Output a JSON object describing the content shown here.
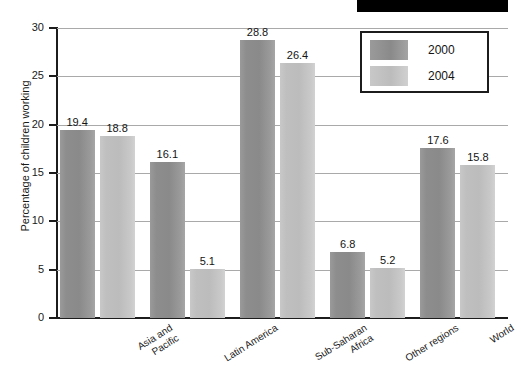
{
  "decor": {
    "top_black_bar": "redaction-bar"
  },
  "chart_data": {
    "type": "bar",
    "title": "",
    "subtitle": "",
    "xlabel": "",
    "ylabel": "Percentage of children working",
    "ylim": [
      0,
      30
    ],
    "yticks": [
      0,
      5,
      10,
      15,
      20,
      25,
      30
    ],
    "ytick_labels": [
      "0",
      "5",
      "10",
      "15",
      "20",
      "25",
      "30"
    ],
    "grid": true,
    "grid_axis": "y",
    "legend_position": "top-right",
    "categories": [
      "Asia and Pacific",
      "Latin America",
      "Sub-Saharan Africa",
      "Other regions",
      "World"
    ],
    "category_lines": [
      [
        "Asia and",
        "Pacific"
      ],
      [
        "Latin America"
      ],
      [
        "Sub-Saharan",
        "Africa"
      ],
      [
        "Other regions"
      ],
      [
        "World"
      ]
    ],
    "series": [
      {
        "name": "2000",
        "color": "#8a8a8a",
        "values": [
          19.4,
          16.1,
          28.8,
          6.8,
          17.6
        ],
        "labels": [
          "19.4",
          "16.1",
          "28.8",
          "6.8",
          "17.6"
        ]
      },
      {
        "name": "2004",
        "color": "#bfbfbf",
        "values": [
          18.8,
          5.1,
          26.4,
          5.2,
          15.8
        ],
        "labels": [
          "18.8",
          "5.1",
          "26.4",
          "5.2",
          "15.8"
        ]
      }
    ]
  },
  "legend": {
    "entries": [
      {
        "label": "2000"
      },
      {
        "label": "2004"
      }
    ]
  },
  "colors": {
    "series_2000": "#8a8a8a",
    "series_2004": "#bfbfbf",
    "axis": "#1c1c1c",
    "gridline": "#a9a9a9",
    "text": "#1a1a1a",
    "black_bar": "#000000"
  }
}
